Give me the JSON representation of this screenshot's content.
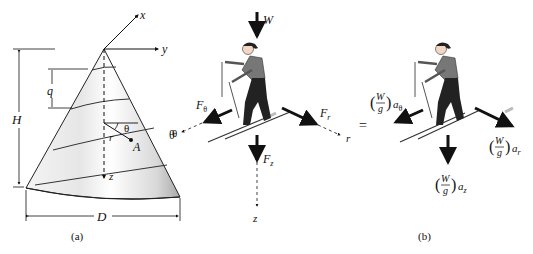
{
  "figure": {
    "panel_a": {
      "caption": "(a)",
      "axes": {
        "x": "x",
        "y": "y",
        "z": "z"
      },
      "dimensions": {
        "height": "H",
        "diameter": "D",
        "pitch": "q"
      },
      "point": "A",
      "radius": "r",
      "angle": "θ",
      "side_angle_label": "θ"
    },
    "panel_b": {
      "caption": "(b)",
      "fbd": {
        "weight": "W",
        "f_theta": {
          "main": "F",
          "sub": "θ"
        },
        "f_r": {
          "main": "F",
          "sub": "r"
        },
        "f_z": {
          "main": "F",
          "sub": "z"
        },
        "axis_theta": "θ",
        "axis_r": "r",
        "axis_z": "z"
      },
      "equals": "=",
      "kinetic": {
        "numerator": "W",
        "denominator": "g",
        "a_theta": {
          "main": "a",
          "sub": "θ"
        },
        "a_r": {
          "main": "a",
          "sub": "r"
        },
        "a_z": {
          "main": "a",
          "sub": "z"
        }
      }
    }
  }
}
